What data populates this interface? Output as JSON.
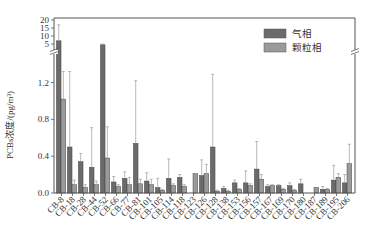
{
  "chart_data": {
    "type": "bar",
    "title": "",
    "xlabel": "",
    "ylabel": "PCBs浓度/(pg/m³)",
    "y_axis_broken": true,
    "ylim_lower": [
      0,
      1.4
    ],
    "ylim_upper": [
      0,
      20
    ],
    "yticks_lower": [
      "0.0",
      "0.4",
      "0.8",
      "1.2"
    ],
    "yticks_upper": [
      "5",
      "10",
      "15",
      "20"
    ],
    "grid": false,
    "legend_position": "upper right",
    "categories": [
      "CB-8",
      "CB-18",
      "CB-28",
      "CB-44",
      "CB-52",
      "CB-66",
      "CB-77",
      "CB-81",
      "CB-101",
      "CB-105",
      "CB-114",
      "CB-118",
      "CB-123",
      "CB-126",
      "CB-128",
      "CB-138",
      "CB-153",
      "CB-156",
      "CB-157",
      "CB-167",
      "CB-169",
      "CB-170",
      "CB-180",
      "CB-187",
      "CB-189",
      "CB-195",
      "CB-206"
    ],
    "series": [
      {
        "name": "气相",
        "color": "#6b6b6b",
        "values": [
          7.0,
          0.5,
          0.34,
          0.28,
          4.5,
          0.12,
          0.16,
          0.54,
          0.13,
          0.06,
          0.16,
          0.17,
          0.0,
          0.19,
          0.5,
          0.05,
          0.11,
          0.11,
          0.26,
          0.07,
          0.08,
          0.08,
          0.1,
          0.0,
          0.04,
          0.14,
          0.11
        ],
        "error_upper": [
          17.0,
          1.32,
          0.43,
          0.71,
          5.0,
          0.18,
          0.23,
          1.22,
          0.22,
          0.16,
          0.37,
          0.2,
          0.0,
          0.36,
          1.29,
          0.07,
          0.14,
          0.24,
          0.56,
          0.09,
          0.09,
          0.11,
          0.15,
          0.0,
          0.07,
          0.3,
          0.2
        ]
      },
      {
        "name": "颗粒相",
        "color": "#9a9a9a",
        "values": [
          1.02,
          0.09,
          0.06,
          0.09,
          0.38,
          0.07,
          0.09,
          0.1,
          0.09,
          0.03,
          0.08,
          0.07,
          0.21,
          0.21,
          0.02,
          0.02,
          0.04,
          0.08,
          0.15,
          0.08,
          0.04,
          0.03,
          0.0,
          0.06,
          0.04,
          0.17,
          0.32
        ],
        "error_upper": [
          1.32,
          0.14,
          0.09,
          0.13,
          0.72,
          0.09,
          0.17,
          0.15,
          0.15,
          0.04,
          0.1,
          0.09,
          0.21,
          0.31,
          0.03,
          0.03,
          0.05,
          0.1,
          0.2,
          0.09,
          0.05,
          0.04,
          0.0,
          0.06,
          0.05,
          0.21,
          0.53
        ]
      }
    ]
  },
  "legend": {
    "items": [
      {
        "label": "气相",
        "color": "#6b6b6b"
      },
      {
        "label": "颗粒相",
        "color": "#9a9a9a"
      }
    ]
  },
  "axes": {
    "ylabel": "PCBs浓度/(pg/m³)"
  }
}
